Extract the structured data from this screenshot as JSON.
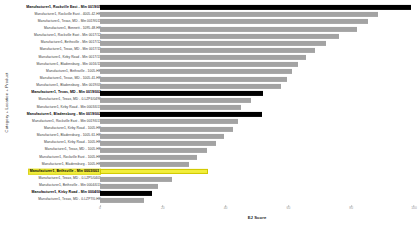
{
  "chart_data": {
    "type": "bar",
    "orientation": "horizontal",
    "title": "",
    "xlabel": "EJ Score",
    "ylabel": "Category + Location + Product",
    "xlim": [
      0,
      100
    ],
    "grid": false,
    "legend": null,
    "colors": {
      "header_bar": "#000000",
      "normal_bar": "#a3a3a3",
      "highlight_bar": "#f2ee3c",
      "highlight_border": "#cfc800"
    },
    "xticks": [
      0,
      20,
      40,
      60,
      80,
      100
    ],
    "xticklabels": [
      "0",
      "20",
      "40",
      "60",
      "80",
      "100"
    ],
    "categories": [
      "Manufacturer1, Rockville East - Min 0019/05",
      "Manufacturer1, Rockville East - 4005-42-HK",
      "Manufacturer1, Texas, MD - Min 0019/011",
      "Manufacturer1, Bennett - 1095-48-HK",
      "Manufacturer1, Rockville East - Min 0017/12",
      "Manufacturer1, Bethsville - Min 0017/12",
      "Manufacturer1, Texas, MD - Min 0017/11",
      "Manufacturer1, Kirby Road - Min 0017/13",
      "Manufacturer1, Bladensburg - Min 0016/11",
      "Manufacturer1, Bethsville - 1005-HK",
      "Manufacturer1, Texas, MD - 1005-41-HK",
      "Manufacturer1, Bladensburg - Min 0019/03",
      "Manufacturer1, Texas, MD - Min 0019/002",
      "Manufacturer1, Texas, MD - 0-LZP4/0496",
      "Manufacturer1, Kirby Road - Min 0003/013",
      "Manufacturer1, Bladensburg - Min 0019/002",
      "Manufacturer1, Rockville East - Min 0019/013",
      "Manufacturer1, Kirby Road - 1005-HK",
      "Manufacturer1, Bladensburg - 1005-61-HK",
      "Manufacturer1, Kirby Road - 1005-HK",
      "Manufacturer1, Texas, MD - 1005-HK",
      "Manufacturer1, Rockville East - 1005-HK",
      "Manufacturer1, Bladensburg - 1005-HK",
      "Manufacturer1, Bethsville - Min 0003/003",
      "Manufacturer1, Texas, MD - 0-LZP5/0401",
      "Manufacturer1, Bethsville - Min 0004/013",
      "Manufacturer1, Kirby Road - Min 0004/00",
      "Manufacturer1, Texas, MD - 0-LZP7/0-HK"
    ],
    "values": [
      99.0,
      88.5,
      85.5,
      82.0,
      76.0,
      72.0,
      68.5,
      65.5,
      63.0,
      61.0,
      59.5,
      57.5,
      52.0,
      48.0,
      45.0,
      51.5,
      44.0,
      42.5,
      39.5,
      37.0,
      34.0,
      31.0,
      28.5,
      34.5,
      23.0,
      18.5,
      16.5,
      14.0
    ],
    "row_styles": [
      "header",
      "normal",
      "normal",
      "normal",
      "normal",
      "normal",
      "normal",
      "normal",
      "normal",
      "normal",
      "normal",
      "normal",
      "header",
      "normal",
      "normal",
      "header",
      "normal",
      "normal",
      "normal",
      "normal",
      "normal",
      "normal",
      "normal",
      "highlight",
      "normal",
      "normal",
      "header",
      "normal"
    ]
  }
}
